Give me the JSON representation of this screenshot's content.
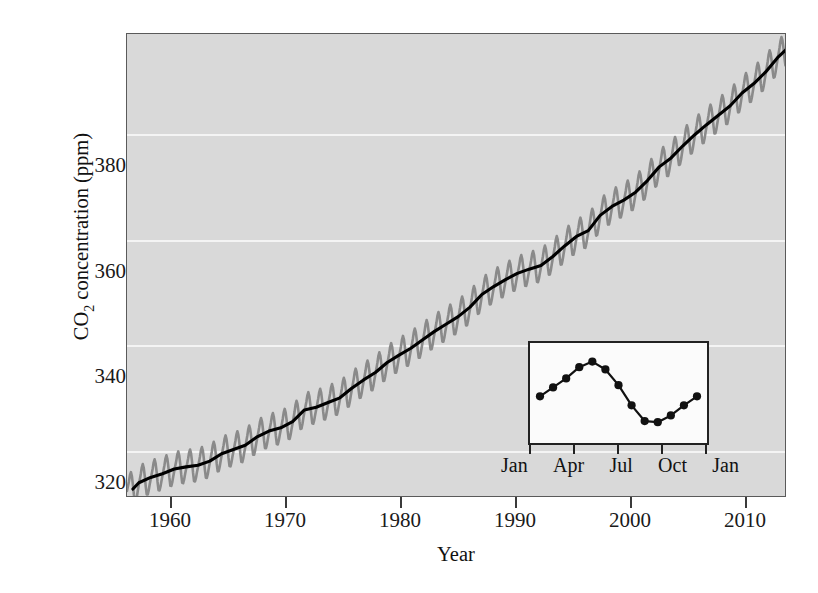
{
  "figure": {
    "background_color": "#ffffff",
    "plot_background_color": "#d9d9d9",
    "gridline_color": "#f4f4f4",
    "trend_color": "#000000",
    "seasonal_color": "#8a8a8a",
    "inset_background_color": "#fbfbfb",
    "footer_fragment": ""
  },
  "chart_data": {
    "type": "line",
    "title": "",
    "xlabel": "Year",
    "ylabel": "CO2 concentration (ppm)",
    "ylabel_rich": {
      "prefix": "CO",
      "subscript": "2",
      "suffix": " concentration (ppm)"
    },
    "xlim": [
      1958.0,
      2013.8
    ],
    "ylim": [
      313.0,
      401.0
    ],
    "grid": true,
    "grid_axis": "y",
    "legend_position": "none",
    "xticks": [
      1960,
      1970,
      1980,
      1990,
      2000,
      2010
    ],
    "xticklabels": [
      "1960",
      "1970",
      "1980",
      "1990",
      "2000",
      "2010"
    ],
    "yticks": [
      320,
      340,
      360,
      380
    ],
    "yticklabels": [
      "320",
      "340",
      "360",
      "380"
    ],
    "series": [
      {
        "name": "Monthly mean CO2 (seasonal oscillation)",
        "color": "#8a8a8a",
        "style": "sawtooth-oscillation",
        "seasonal_amplitude_ppm": 3.2,
        "note": "Monthly values oscillate about the annual trend; peak in May, minimum in September-October"
      },
      {
        "name": "Annual mean CO2 trend",
        "color": "#000000",
        "style": "solid",
        "x": [
          1958.5,
          1959,
          1960,
          1961,
          1962,
          1963,
          1964,
          1965,
          1966,
          1967,
          1968,
          1969,
          1970,
          1971,
          1972,
          1973,
          1974,
          1975,
          1976,
          1977,
          1978,
          1979,
          1980,
          1981,
          1982,
          1983,
          1984,
          1985,
          1986,
          1987,
          1988,
          1989,
          1990,
          1991,
          1992,
          1993,
          1994,
          1995,
          1996,
          1997,
          1998,
          1999,
          2000,
          2001,
          2002,
          2003,
          2004,
          2005,
          2006,
          2007,
          2008,
          2009,
          2010,
          2011,
          2012,
          2013,
          2013.7
        ],
        "y": [
          314.7,
          315.9,
          316.9,
          317.6,
          318.5,
          318.9,
          319.2,
          320.0,
          321.4,
          322.2,
          323.0,
          324.6,
          325.7,
          326.3,
          327.5,
          329.7,
          330.2,
          331.1,
          332.0,
          333.8,
          335.4,
          336.8,
          338.7,
          340.1,
          341.4,
          343.0,
          344.6,
          346.0,
          347.4,
          349.2,
          351.6,
          353.1,
          354.4,
          355.6,
          356.4,
          357.1,
          358.8,
          360.8,
          362.6,
          363.7,
          366.6,
          368.3,
          369.5,
          371.0,
          373.2,
          375.8,
          377.5,
          379.8,
          381.9,
          383.8,
          385.6,
          387.4,
          389.8,
          391.6,
          393.8,
          396.5,
          398.0
        ]
      }
    ],
    "inset": {
      "type": "line",
      "title": "",
      "xlabel": "",
      "ylabel": "",
      "note": "Mean seasonal cycle of atmospheric CO2 over one year",
      "xticks": [
        "Jan",
        "Apr",
        "Jul",
        "Oct",
        "Jan"
      ],
      "xticklabels": [
        "Jan",
        "Apr",
        "Jul",
        "Oct",
        "Jan"
      ],
      "categories": [
        "Jan",
        "Feb",
        "Mar",
        "Apr",
        "May",
        "Jun",
        "Jul",
        "Aug",
        "Sep",
        "Oct",
        "Nov",
        "Dec",
        "Jan"
      ],
      "values": [
        330.0,
        330.8,
        331.6,
        332.6,
        333.1,
        332.4,
        331.0,
        329.2,
        327.8,
        327.7,
        328.3,
        329.2,
        330.0
      ],
      "ylim": [
        327.0,
        333.6
      ],
      "marker": "filled-circle",
      "marker_color": "#111111",
      "line_color": "#111111",
      "grid": false
    }
  }
}
